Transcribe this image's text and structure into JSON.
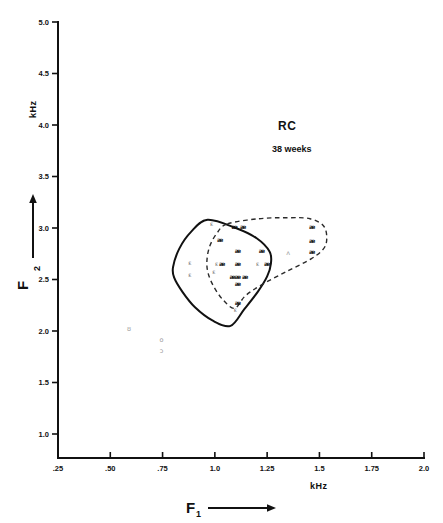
{
  "figure": {
    "title": "RC",
    "subtitle": "38 weeks"
  },
  "axes": {
    "x_title": "F",
    "x_title_sub": "1",
    "x_unit": "kHz",
    "y_title": "F",
    "y_title_sub": "2",
    "y_unit": "kHz",
    "x_ticks": [
      ".25",
      ".50",
      ".75",
      "1.0",
      "1.25",
      "1.5",
      "1.75",
      "2.0"
    ],
    "y_ticks": [
      "1.0",
      "1.5",
      "2.0",
      "2.5",
      "3.0",
      "3.5",
      "4.0",
      "4.5",
      "5.0"
    ]
  },
  "chart_data": {
    "type": "scatter",
    "title": "RC 38 weeks",
    "subtitle": "38 weeks",
    "xlabel": "F1 (kHz)",
    "ylabel": "F2 (kHz)",
    "xlim": [
      0.25,
      2.0
    ],
    "ylim": [
      0.8125,
      5.0
    ],
    "grid": false,
    "legend": "none",
    "xticks": [
      0.25,
      0.5,
      0.75,
      1.0,
      1.25,
      1.5,
      1.75,
      2.0
    ],
    "yticks": [
      1.0,
      1.5,
      2.0,
      2.5,
      3.0,
      3.5,
      4.0,
      4.5,
      5.0
    ],
    "series": [
      {
        "name": "ae",
        "symbol": "æ",
        "style": "bold-dark",
        "points": [
          [
            1.095,
            3.01
          ],
          [
            1.135,
            3.01
          ],
          [
            1.465,
            3.01
          ],
          [
            1.025,
            2.89
          ],
          [
            1.465,
            2.88
          ],
          [
            1.11,
            2.78
          ],
          [
            1.225,
            2.78
          ],
          [
            1.465,
            2.77
          ],
          [
            1.035,
            2.65
          ],
          [
            1.11,
            2.65
          ],
          [
            1.25,
            2.65
          ],
          [
            1.085,
            2.53
          ],
          [
            1.11,
            2.53
          ],
          [
            1.145,
            2.53
          ],
          [
            1.11,
            2.46
          ],
          [
            1.11,
            2.27
          ]
        ]
      },
      {
        "name": "epsilon",
        "symbol": "ɛ",
        "style": "light-gray",
        "points": [
          [
            0.985,
            3.04
          ],
          [
            0.88,
            2.66
          ],
          [
            1.008,
            2.655
          ],
          [
            1.205,
            2.655
          ],
          [
            0.88,
            2.55
          ],
          [
            0.995,
            2.575
          ],
          [
            1.098,
            2.205
          ]
        ]
      },
      {
        "name": "caret-a",
        "symbol": "ʌ",
        "style": "faint-gray",
        "points": [
          [
            1.35,
            2.76
          ]
        ]
      },
      {
        "name": "upsilon",
        "symbol": "ʊ",
        "style": "faint-gray",
        "points": [
          [
            0.59,
            2.02
          ]
        ]
      },
      {
        "name": "o",
        "symbol": "o",
        "style": "faint-gray",
        "points": [
          [
            0.745,
            1.915
          ]
        ]
      },
      {
        "name": "open-o",
        "symbol": "ɔ",
        "style": "faint-gray",
        "points": [
          [
            0.745,
            1.805
          ]
        ]
      }
    ],
    "contours": [
      {
        "name": "solid-contour",
        "linestyle": "solid",
        "vertices": [
          [
            0.965,
            3.08
          ],
          [
            1.1,
            3.0
          ],
          [
            1.2,
            2.9
          ],
          [
            1.262,
            2.77
          ],
          [
            1.268,
            2.655
          ],
          [
            1.25,
            2.53
          ],
          [
            1.205,
            2.38
          ],
          [
            1.14,
            2.21
          ],
          [
            1.075,
            2.05
          ],
          [
            0.99,
            2.1
          ],
          [
            0.905,
            2.23
          ],
          [
            0.845,
            2.38
          ],
          [
            0.805,
            2.52
          ],
          [
            0.8,
            2.62
          ],
          [
            0.83,
            2.8
          ],
          [
            0.885,
            2.96
          ]
        ]
      },
      {
        "name": "dashed-contour",
        "linestyle": "dashed",
        "vertices": [
          [
            1.06,
            3.04
          ],
          [
            1.21,
            3.09
          ],
          [
            1.355,
            3.1
          ],
          [
            1.455,
            3.09
          ],
          [
            1.52,
            3.02
          ],
          [
            1.535,
            2.9
          ],
          [
            1.52,
            2.8
          ],
          [
            1.46,
            2.7
          ],
          [
            1.345,
            2.58
          ],
          [
            1.225,
            2.45
          ],
          [
            1.145,
            2.34
          ],
          [
            1.095,
            2.22
          ],
          [
            1.04,
            2.3
          ],
          [
            0.995,
            2.43
          ],
          [
            0.968,
            2.56
          ],
          [
            0.962,
            2.68
          ],
          [
            0.975,
            2.82
          ],
          [
            1.01,
            2.95
          ]
        ]
      }
    ]
  }
}
